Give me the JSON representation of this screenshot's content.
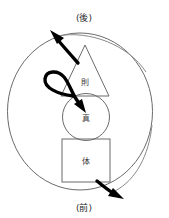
{
  "diagram": {
    "title_visible": false,
    "background_color": "#ffffff",
    "outline_color": "#6b6b6b",
    "arrow_color": "#000000",
    "nodes": [
      {
        "id": "triangle",
        "shape": "triangle",
        "label": "則",
        "position": "top"
      },
      {
        "id": "circle",
        "shape": "circle",
        "label": "真",
        "position": "middle"
      },
      {
        "id": "square",
        "shape": "square",
        "label": "体",
        "position": "bottom"
      }
    ],
    "axis_labels": {
      "top": "(後)",
      "bottom": "(前)"
    },
    "arrows": [
      {
        "id": "upper-left-arrow",
        "from": "triangle",
        "to": "後",
        "direction": "up-left",
        "style": "thick-curved"
      },
      {
        "id": "loop-arrow",
        "from": "triangle",
        "to": "circle",
        "direction": "loop-into-center",
        "style": "thick-loop"
      },
      {
        "id": "lower-right-arrow",
        "from": "square",
        "to": "前",
        "direction": "down-right",
        "style": "thick-curved"
      }
    ],
    "cycle_ring": {
      "shape": "circle",
      "style": "thin-outline"
    }
  }
}
